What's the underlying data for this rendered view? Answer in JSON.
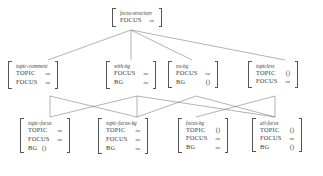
{
  "diagram": {
    "line_color": "#666666",
    "text_color": "#3a3a3a",
    "background": "#ffffff"
  },
  "nodes": {
    "root": {
      "type": "focus-structure",
      "features": [
        {
          "attr": "FOCUS",
          "value": "ne"
        }
      ]
    },
    "level2": [
      {
        "type": "topic-comment",
        "features": [
          {
            "attr": "TOPIC",
            "value": "ne"
          },
          {
            "attr": "FOCUS",
            "value": "ne"
          }
        ]
      },
      {
        "type": "with-bg",
        "features": [
          {
            "attr": "FOCUS",
            "value": "ne"
          },
          {
            "attr": "BG",
            "value": "ne"
          }
        ]
      },
      {
        "type": "no-bg",
        "features": [
          {
            "attr": "FOCUS",
            "value": "ne"
          },
          {
            "attr": "BG",
            "value": "()"
          }
        ]
      },
      {
        "type": "topicless",
        "features": [
          {
            "attr": "TOPIC",
            "value": "()"
          },
          {
            "attr": "FOCUS",
            "value": "ne"
          }
        ]
      }
    ],
    "level3": [
      {
        "type": "topic-focus",
        "features": [
          {
            "attr": "TOPIC",
            "value": "ne"
          },
          {
            "attr": "FOCUS",
            "value": "ne"
          },
          {
            "attr": "BG",
            "value": "()"
          }
        ]
      },
      {
        "type": "topic-focus-bg",
        "features": [
          {
            "attr": "TOPIC",
            "value": "ne"
          },
          {
            "attr": "FOCUS",
            "value": "ne"
          },
          {
            "attr": "BG",
            "value": "ne"
          }
        ]
      },
      {
        "type": "focus-bg",
        "features": [
          {
            "attr": "TOPIC",
            "value": "()"
          },
          {
            "attr": "FOCUS",
            "value": "ne"
          },
          {
            "attr": "BG",
            "value": "ne"
          }
        ]
      },
      {
        "type": "all-focus",
        "features": [
          {
            "attr": "TOPIC",
            "value": "()"
          },
          {
            "attr": "FOCUS",
            "value": "ne"
          },
          {
            "attr": "BG",
            "value": "()"
          }
        ]
      }
    ]
  }
}
